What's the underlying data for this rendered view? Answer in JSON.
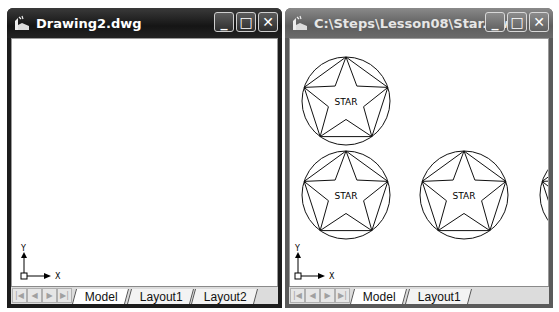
{
  "windows": [
    {
      "title": "Drawing2.dwg",
      "active": true,
      "controls": {
        "minimize": "_",
        "maximize": "□",
        "close": "✕"
      },
      "tabs": [
        {
          "label": "Model",
          "active": true
        },
        {
          "label": "Layout1",
          "active": false
        },
        {
          "label": "Layout2",
          "active": false
        }
      ],
      "ucs": {
        "x_label": "X",
        "y_label": "Y"
      },
      "nav_buttons": [
        "first",
        "prev",
        "next",
        "last"
      ]
    },
    {
      "title": "C:\\Steps\\Lesson08\\Star.dwg",
      "active": false,
      "controls": {
        "minimize": "_",
        "maximize": "□",
        "close": "✕"
      },
      "tabs": [
        {
          "label": "Model",
          "active": true
        },
        {
          "label": "Layout1",
          "active": false
        }
      ],
      "ucs": {
        "x_label": "X",
        "y_label": "Y"
      },
      "nav_buttons": [
        "first",
        "prev",
        "next",
        "last"
      ],
      "stars": [
        {
          "label": "STAR",
          "cx": 346,
          "cy": 101,
          "r": 44
        },
        {
          "label": "STAR",
          "cx": 346,
          "cy": 195,
          "r": 44
        },
        {
          "label": "STAR",
          "cx": 464,
          "cy": 195,
          "r": 44
        },
        {
          "label": "",
          "cx": 584,
          "cy": 195,
          "r": 44
        }
      ]
    }
  ],
  "nav_glyphs": {
    "first": "|◀",
    "prev": "◀",
    "next": "▶",
    "last": "▶|"
  }
}
